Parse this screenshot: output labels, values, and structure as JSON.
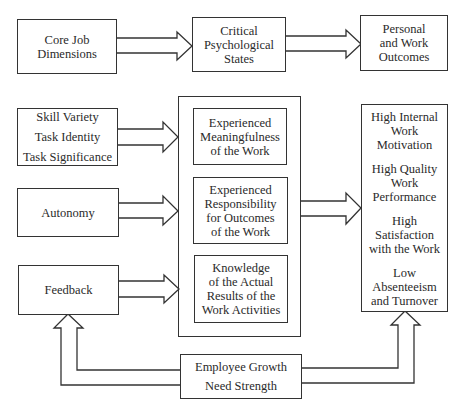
{
  "top_row": {
    "core_job_dimensions": [
      "Core Job",
      "Dimensions"
    ],
    "critical_psychological_states": [
      "Critical",
      "Psychological",
      "States"
    ],
    "personal_work_outcomes": [
      "Personal",
      "and Work",
      "Outcomes"
    ]
  },
  "core_dimensions": {
    "group1": [
      "Skill Variety",
      "Task Identity",
      "Task Significance"
    ],
    "autonomy": "Autonomy",
    "feedback": "Feedback"
  },
  "psychological_states": {
    "meaningfulness": [
      "Experienced",
      "Meaningfulness",
      "of the Work"
    ],
    "responsibility": [
      "Experienced",
      "Responsibility",
      "for Outcomes",
      "of the Work"
    ],
    "knowledge": [
      "Knowledge",
      "of the Actual",
      "Results of the",
      "Work Activities"
    ]
  },
  "outcomes": [
    [
      "High Internal",
      "Work",
      "Motivation"
    ],
    [
      "High Quality",
      "Work",
      "Performance"
    ],
    [
      "High",
      "Satisfaction",
      "with the Work"
    ],
    [
      "Low",
      "Absenteeism",
      "and Turnover"
    ]
  ],
  "moderator": [
    "Employee Growth",
    "Need Strength"
  ]
}
